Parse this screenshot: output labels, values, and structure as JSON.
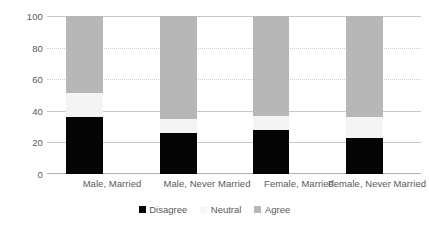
{
  "chart_data": {
    "type": "bar",
    "subtype": "stacked-100",
    "title": "",
    "subtitle": "",
    "xlabel": "",
    "ylabel": "",
    "ylim": [
      0,
      100
    ],
    "yticks": [
      0,
      20,
      40,
      60,
      80,
      100
    ],
    "grid": true,
    "legend_position": "bottom",
    "categories": [
      "Male, Married",
      "Male, Never Married",
      "Female, Married",
      "Female, Never Married"
    ],
    "series": [
      {
        "name": "Disagree",
        "color": "#050505",
        "values": [
          36,
          26,
          28,
          23
        ]
      },
      {
        "name": "Neutral",
        "color": "#f4f4f4",
        "values": [
          15,
          9,
          9,
          13
        ]
      },
      {
        "name": "Agree",
        "color": "#b7b7b7",
        "values": [
          49,
          65,
          63,
          64
        ]
      }
    ]
  },
  "axis": {
    "y_tick_labels": [
      "0",
      "20",
      "40",
      "60",
      "80",
      "100"
    ]
  },
  "legend": {
    "items": [
      {
        "label": "Disagree",
        "swatch": "black-square-icon"
      },
      {
        "label": "Neutral",
        "swatch": "white-square-icon"
      },
      {
        "label": "Agree",
        "swatch": "gray-square-icon"
      }
    ]
  }
}
